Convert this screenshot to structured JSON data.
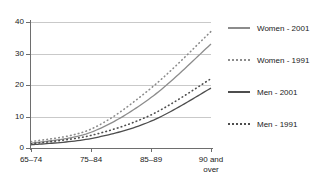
{
  "chart_data": {
    "type": "line",
    "title": "",
    "xlabel": "",
    "ylabel": "",
    "categories": [
      "65–74",
      "75–84",
      "85–89",
      "90 and over"
    ],
    "category_lines": [
      [
        "65–74"
      ],
      [
        "75–84"
      ],
      [
        "85–89"
      ],
      [
        "90 and",
        "over"
      ]
    ],
    "ylim": [
      0,
      40
    ],
    "yticks": [
      0,
      10,
      20,
      30,
      40
    ],
    "ytick_labels": [
      "0",
      "10",
      "20",
      "30",
      "40"
    ],
    "grid": true,
    "grid_axis": "y",
    "legend_position": "right",
    "series": [
      {
        "name": "Women - 2001",
        "style": "solid",
        "color": "#8c8c8c",
        "values": [
          1.5,
          5.0,
          16.0,
          33.0
        ]
      },
      {
        "name": "Women - 1991",
        "style": "dotted",
        "color": "#8c8c8c",
        "values": [
          2.0,
          6.0,
          19.0,
          37.0
        ]
      },
      {
        "name": "Men - 2001",
        "style": "solid",
        "color": "#4d4d4d",
        "values": [
          1.0,
          3.0,
          8.5,
          19.0
        ]
      },
      {
        "name": "Men - 1991",
        "style": "dotted",
        "color": "#4d4d4d",
        "values": [
          1.3,
          4.0,
          10.5,
          22.0
        ]
      }
    ]
  },
  "colors": {
    "axis": "#6e6e6e",
    "grid": "#c9c9c9",
    "text": "#1a1a1a",
    "women": "#8c8c8c",
    "men": "#4d4d4d",
    "background": "#ffffff"
  }
}
